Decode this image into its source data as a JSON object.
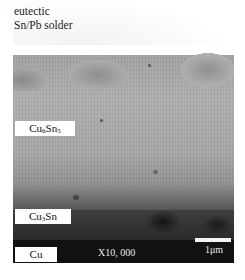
{
  "figure": {
    "title_line1": "eutectic",
    "title_line2": "Sn/Pb solder",
    "layers": [
      {
        "label_main": "Cu",
        "label_sub": "6",
        "label_main2": "Sn",
        "label_sub2": "5"
      },
      {
        "label_main": "Cu",
        "label_sub": "3",
        "label_main2": "Sn",
        "label_sub2": ""
      },
      {
        "label_main": "Cu",
        "label_sub": "",
        "label_main2": "",
        "label_sub2": ""
      }
    ],
    "magnification": "X10, 000",
    "scale_bar_label": "1μm"
  }
}
